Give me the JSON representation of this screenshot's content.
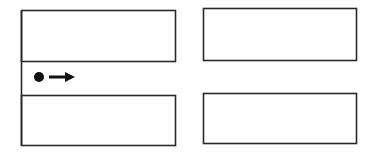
{
  "diagram": {
    "type": "intersection-map",
    "stroke_color": "#2a2a2a",
    "background_color": "#ffffff",
    "blocks": [
      {
        "name": "top-left-block",
        "x": 21,
        "y": 10,
        "w": 154,
        "h": 51
      },
      {
        "name": "top-right-block",
        "x": 203,
        "y": 8,
        "w": 153,
        "h": 52
      },
      {
        "name": "bottom-left-block",
        "x": 21,
        "y": 95,
        "w": 154,
        "h": 50
      },
      {
        "name": "bottom-right-block",
        "x": 203,
        "y": 93,
        "w": 153,
        "h": 50
      }
    ],
    "roads": {
      "horizontal": {
        "y_top": 61,
        "y_bottom": 95
      },
      "vertical": {
        "x_left": 175,
        "x_right": 203
      }
    },
    "agent": {
      "symbol": "dot",
      "cx": 39,
      "cy": 77,
      "r": 5
    },
    "direction_arrow": {
      "direction": "right",
      "x1": 49,
      "y": 77,
      "x2": 75
    }
  }
}
